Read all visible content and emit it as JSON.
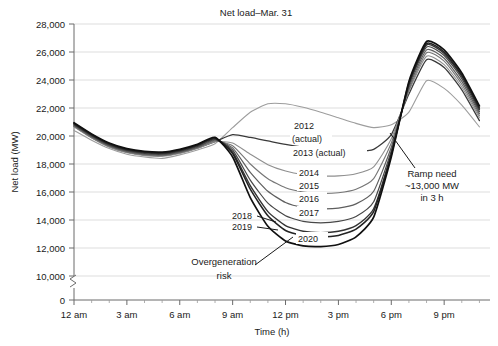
{
  "chart_data": {
    "type": "line",
    "title": "Net load–Mar. 31",
    "xlabel": "Time (h)",
    "ylabel": "Net load (MW)",
    "xlim": [
      0,
      24
    ],
    "ylim": [
      0,
      28000
    ],
    "y_axis_break": true,
    "y_break_between": [
      0,
      10000
    ],
    "grid": true,
    "legend_position": "inline-annotations",
    "x_tick_labels": [
      "12 am",
      "3 am",
      "6 am",
      "9 am",
      "12 pm",
      "3 pm",
      "6 pm",
      "9 pm"
    ],
    "x_tick_values": [
      0,
      3,
      6,
      9,
      12,
      15,
      18,
      21
    ],
    "x_minor_tick_interval": 1,
    "y_tick_labels": [
      "0",
      "10,000",
      "12,000",
      "14,000",
      "16,000",
      "18,000",
      "20,000",
      "22,000",
      "24,000",
      "26,000",
      "28,000"
    ],
    "y_tick_values": [
      0,
      10000,
      12000,
      14000,
      16000,
      18000,
      20000,
      22000,
      24000,
      26000,
      28000
    ],
    "x": [
      0,
      1,
      2,
      3,
      4,
      5,
      6,
      7,
      8,
      9,
      10,
      11,
      12,
      13,
      14,
      15,
      16,
      17,
      18,
      19,
      20,
      21,
      22,
      23
    ],
    "series": [
      {
        "name": "2012 (actual)",
        "label": "2012\n(actual)",
        "color": "#9d9d9d",
        "width": 1.1,
        "values": [
          20400,
          19700,
          19100,
          18700,
          18500,
          18400,
          18650,
          19000,
          19450,
          20600,
          21700,
          22300,
          22300,
          22050,
          21700,
          21300,
          20900,
          20600,
          20800,
          21700,
          23950,
          23400,
          22200,
          20650
        ]
      },
      {
        "name": "2013 (actual)",
        "label": "2013 (actual)",
        "color": "#3a3a3a",
        "width": 1.3,
        "values": [
          20700,
          19900,
          19250,
          18850,
          18650,
          18600,
          18800,
          19150,
          19600,
          20100,
          19900,
          19650,
          19400,
          19200,
          19050,
          18950,
          18900,
          19050,
          20100,
          23000,
          25450,
          24900,
          23300,
          21100
        ]
      },
      {
        "name": "2014",
        "label": "2014",
        "color": "#8f8f8f",
        "width": 1.1,
        "values": [
          20650,
          19850,
          19200,
          18800,
          18600,
          18550,
          18750,
          19100,
          19600,
          19500,
          18700,
          17950,
          17500,
          17250,
          17150,
          17150,
          17300,
          17800,
          19800,
          23200,
          25700,
          25100,
          23500,
          21300
        ]
      },
      {
        "name": "2015",
        "label": "2015",
        "color": "#767676",
        "width": 1.1,
        "values": [
          20700,
          19900,
          19250,
          18850,
          18650,
          18600,
          18800,
          19150,
          19650,
          19300,
          18000,
          16950,
          16300,
          16000,
          15900,
          15950,
          16200,
          16950,
          19500,
          23300,
          25950,
          25350,
          23700,
          21450
        ]
      },
      {
        "name": "2016",
        "label": "2016",
        "color": "#5e5e5e",
        "width": 1.2,
        "values": [
          20750,
          19950,
          19300,
          18900,
          18700,
          18650,
          18850,
          19200,
          19700,
          19150,
          17400,
          16050,
          15250,
          14900,
          14800,
          14850,
          15150,
          16050,
          19200,
          23450,
          26150,
          25550,
          23900,
          21600
        ]
      },
      {
        "name": "2017",
        "label": "2017",
        "color": "#474747",
        "width": 1.2,
        "values": [
          20800,
          20000,
          19350,
          18950,
          18750,
          18700,
          18900,
          19250,
          19750,
          19000,
          16850,
          15200,
          14300,
          13900,
          13800,
          13900,
          14250,
          15300,
          18950,
          23600,
          26350,
          25750,
          24100,
          21750
        ]
      },
      {
        "name": "2018",
        "label": "2018",
        "color": "#333333",
        "width": 1.4,
        "values": [
          20850,
          20050,
          19400,
          19000,
          18800,
          18750,
          18950,
          19300,
          19800,
          18850,
          16450,
          14600,
          13600,
          13200,
          13100,
          13200,
          13600,
          14800,
          18750,
          23700,
          26500,
          25900,
          24250,
          21900
        ]
      },
      {
        "name": "2019",
        "label": "2019",
        "color": "#232323",
        "width": 1.5,
        "values": [
          20900,
          20100,
          19450,
          19050,
          18850,
          18800,
          19000,
          19350,
          19850,
          18750,
          16200,
          14300,
          13250,
          12900,
          12800,
          12900,
          13350,
          14600,
          18650,
          23800,
          26600,
          26000,
          24350,
          22000
        ]
      },
      {
        "name": "2020",
        "label": "2020",
        "color": "#101010",
        "width": 1.7,
        "values": [
          20950,
          20150,
          19500,
          19100,
          18900,
          18850,
          19050,
          19400,
          19900,
          18500,
          15600,
          13550,
          12500,
          12150,
          12100,
          12250,
          12800,
          14200,
          18500,
          23900,
          26750,
          26150,
          24500,
          22150
        ]
      }
    ],
    "annotations": [
      {
        "name": "ramp-need",
        "lines": [
          "Ramp need",
          "~13,000 MW",
          "in 3 h"
        ],
        "leader": true
      },
      {
        "name": "overgeneration-risk",
        "lines": [
          "Overgeneration",
          "risk"
        ],
        "leader": true
      }
    ]
  }
}
